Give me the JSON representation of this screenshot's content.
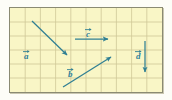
{
  "figure": {
    "panel": {
      "background_color": "#f9f6c6",
      "border_color": "#8a8a72",
      "grid_color": "#cfc898",
      "grid_columns": 10,
      "grid_rows": 6,
      "x": 9,
      "y": 7,
      "width": 154,
      "height": 86
    },
    "vector_color": "#2f7f93",
    "vectors": [
      {
        "id": "a",
        "label": "a",
        "x1": 22,
        "y1": 13,
        "x2": 57,
        "y2": 47,
        "label_x": 14,
        "label_y": 44,
        "direction": "down-right"
      },
      {
        "id": "c",
        "label": "c",
        "x1": 65,
        "y1": 31,
        "x2": 98,
        "y2": 31,
        "label_x": 76,
        "label_y": 22,
        "direction": "right"
      },
      {
        "id": "b",
        "label": "b",
        "x1": 53,
        "y1": 79,
        "x2": 101,
        "y2": 49,
        "label_x": 58,
        "label_y": 62,
        "direction": "up-right"
      },
      {
        "id": "d",
        "label": "d",
        "x1": 135,
        "y1": 33,
        "x2": 135,
        "y2": 64,
        "label_x": 126,
        "label_y": 44,
        "direction": "down"
      }
    ]
  }
}
